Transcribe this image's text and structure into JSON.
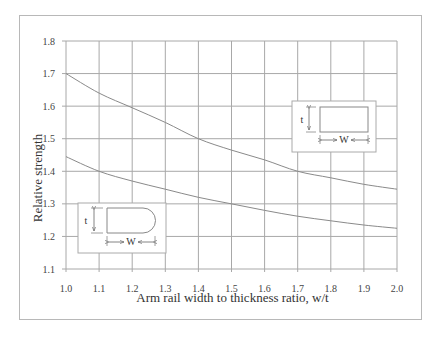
{
  "chart_data": {
    "type": "line",
    "title": "",
    "xlabel": "Arm rail width to thickness ratio, w/t",
    "ylabel": "Relative strength",
    "xlim": [
      1.0,
      2.0
    ],
    "ylim": [
      1.1,
      1.8
    ],
    "grid": true,
    "x_ticks": [
      "1.0",
      "1.1",
      "1.2",
      "1.3",
      "1.4",
      "1.5",
      "1.6",
      "1.7",
      "1.8",
      "1.9",
      "2.0"
    ],
    "y_ticks": [
      "1.1",
      "1.2",
      "1.3",
      "1.4",
      "1.5",
      "1.6",
      "1.7",
      "1.8"
    ],
    "x": [
      1.0,
      1.1,
      1.2,
      1.3,
      1.4,
      1.5,
      1.6,
      1.7,
      1.8,
      1.9,
      2.0
    ],
    "series": [
      {
        "name": "Rectangular section",
        "values": [
          1.7,
          1.64,
          1.595,
          1.55,
          1.5,
          1.465,
          1.435,
          1.4,
          1.38,
          1.36,
          1.345
        ]
      },
      {
        "name": "Rounded (half-round end) section",
        "values": [
          1.445,
          1.4,
          1.37,
          1.345,
          1.32,
          1.3,
          1.28,
          1.262,
          1.248,
          1.235,
          1.225
        ]
      }
    ],
    "annotations": [
      {
        "type": "inset",
        "shape": "rectangle",
        "labels": [
          "t",
          "W"
        ],
        "position": "upper-right"
      },
      {
        "type": "inset",
        "shape": "rounded-end",
        "labels": [
          "t",
          "W"
        ],
        "position": "lower-left"
      }
    ]
  },
  "labels": {
    "xlabel": "Arm rail width to thickness ratio, w/t",
    "ylabel": "Relative strength",
    "inset_t": "t",
    "inset_w": "W"
  },
  "colors": {
    "grid": "#a8a8a8",
    "curve": "#8a8a8a",
    "text": "#444444",
    "frame": "#b8b8b8"
  }
}
